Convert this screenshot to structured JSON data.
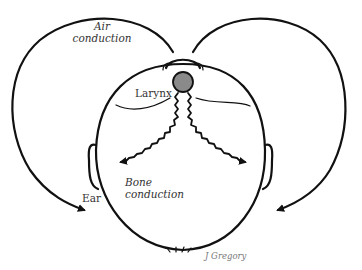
{
  "labels": {
    "air_conduction_line1": "Air",
    "air_conduction_line2": "conduction",
    "larynx": "Larynx",
    "ear": "Ear",
    "bone_conduction_line1": "Bone",
    "bone_conduction_line2": "conduction",
    "credit": "J Gregory"
  },
  "colors": {
    "line": "#111111",
    "larynx_fill": "#8a8a8a",
    "text": "#333333",
    "background": "#ffffff"
  },
  "icons": {
    "arrowhead": "filled-triangle-arrow"
  }
}
